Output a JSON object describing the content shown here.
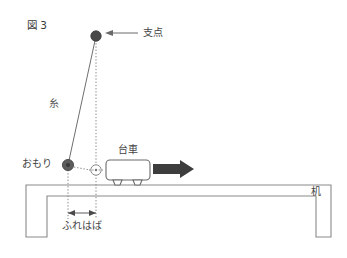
{
  "figure": {
    "title": "図 3",
    "type": "science-diagram"
  },
  "labels": {
    "fulcrum": "支点",
    "string": "糸",
    "weight": "おもり",
    "cart": "台車",
    "swing_width": "ふれはば",
    "desk": "机"
  },
  "colors": {
    "line": "#6a6a6a",
    "desk": "#8a8a8a",
    "bob": "#5d5d5d",
    "pivot": "#4a4a4a",
    "arrow": "#3d3d3d",
    "text": "#444444",
    "background": "#ffffff"
  },
  "geometry": {
    "pivot": {
      "x": 96,
      "y": 36
    },
    "bob": {
      "x": 68,
      "y": 165
    },
    "rest_position": {
      "x": 96,
      "y": 170
    },
    "string_length": 130,
    "swing_width_px": 28,
    "desk_top_y": 185,
    "desk_left_x": 26,
    "desk_right_x": 331
  },
  "annotations": {
    "cart_direction": "right",
    "cart_arrow_label": "台車が動く向き"
  }
}
